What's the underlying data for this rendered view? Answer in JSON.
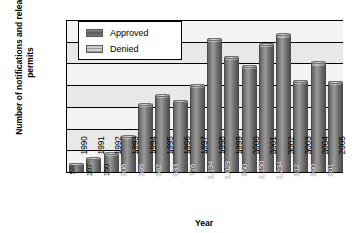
{
  "chart_data": {
    "type": "bar",
    "title": "",
    "xlabel": "Year",
    "ylabel": "Number of notifications and release permits",
    "ylim": [
      0,
      1400
    ],
    "ytick_labels": [
      "0",
      "200",
      "400",
      "600",
      "800",
      "1,000",
      "1,200",
      "1,400"
    ],
    "ytick_values": [
      0,
      200,
      400,
      600,
      800,
      1000,
      1200,
      1400
    ],
    "grid": true,
    "stacked": true,
    "legend_position": "top-left-inside",
    "categories": [
      "1990",
      "1991",
      "1992",
      "1993",
      "1994",
      "1995",
      "1996",
      "1997",
      "1998",
      "1999",
      "2000",
      "2001",
      "2002",
      "2003",
      "2004",
      "2005"
    ],
    "series": [
      {
        "name": "Approved",
        "color": "#6e6e6e",
        "values": [
          58,
          107,
          150,
          306,
          599,
          682,
          633,
          776,
          1194,
          1029,
          950,
          1150,
          1234,
          812,
          980,
          801
        ],
        "labels": [
          "58",
          "107",
          "150",
          "306",
          "599",
          "682",
          "633",
          "776",
          "1,194",
          "1,029",
          "950",
          "1,150",
          "1,234",
          "812",
          "980",
          "801"
        ]
      },
      {
        "name": "Denied",
        "color": "#b4b4b4",
        "values": [
          12,
          14,
          16,
          18,
          20,
          22,
          20,
          24,
          28,
          26,
          24,
          26,
          28,
          24,
          26,
          24
        ]
      }
    ]
  },
  "legend": {
    "items": [
      {
        "label": "Approved",
        "swatch": "approved-swatch"
      },
      {
        "label": "Denied",
        "swatch": "denied-swatch"
      }
    ]
  },
  "axes": {
    "y_title": "Number of notifications and release permits",
    "x_title": "Year"
  }
}
